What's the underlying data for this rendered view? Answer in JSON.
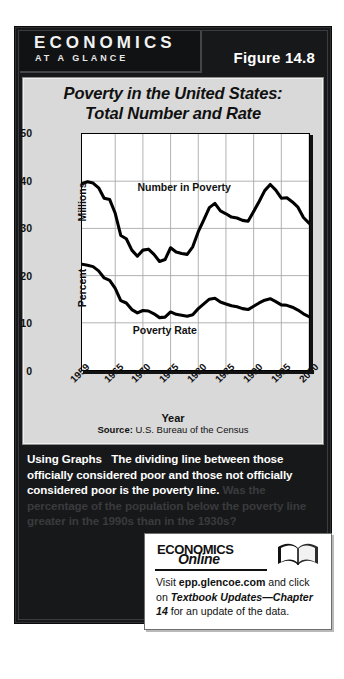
{
  "header": {
    "brand_line1": "ECONOMICS",
    "brand_line2": "AT A GLANCE",
    "figure_label": "Figure 14.8"
  },
  "chart_card": {
    "title_line1": "Poverty in the United States:",
    "title_line2": "Total Number and Rate",
    "source": "U.S. Bureau of the Census",
    "source_prefix": "Source:"
  },
  "caption": {
    "lead": "Using Graphs",
    "body": "The dividing line between those officially considered poor and those not officially considered poor is the poverty line.",
    "question": "Was the percentage of the population below the poverty line greater in the 1990s than in the 1930s?"
  },
  "online": {
    "brand_top": "ECONOMICS",
    "brand_bottom": "Online",
    "text_before": "Visit ",
    "link": "epp.glencoe.com",
    "text_mid": " and click on ",
    "emphasis": "Textbook Updates—Chapter 14",
    "text_after": " for an update of the data.",
    "icon": "open-book-icon"
  },
  "chart_data": {
    "type": "line",
    "title": "Poverty in the United States: Total Number and Rate",
    "xlabel": "Year",
    "ylabel": "Millions / Percent",
    "ylabel_upper": "Millions",
    "ylabel_lower": "Percent",
    "grid": true,
    "legend_position": "inline-annotations",
    "xlim": [
      1959,
      2000
    ],
    "ylim": [
      0,
      50
    ],
    "yticks": [
      0,
      10,
      20,
      30,
      40,
      50
    ],
    "xticks": [
      1959,
      1965,
      1970,
      1975,
      1980,
      1985,
      1990,
      1995,
      2000
    ],
    "x": [
      1959,
      1960,
      1961,
      1962,
      1963,
      1964,
      1965,
      1966,
      1967,
      1968,
      1969,
      1970,
      1971,
      1972,
      1973,
      1974,
      1975,
      1976,
      1977,
      1978,
      1979,
      1980,
      1981,
      1982,
      1983,
      1984,
      1985,
      1986,
      1987,
      1988,
      1989,
      1990,
      1991,
      1992,
      1993,
      1994,
      1995,
      1996,
      1997,
      1998,
      1999,
      2000
    ],
    "series": [
      {
        "name": "Number in Poverty",
        "unit": "millions",
        "values": [
          39.5,
          39.9,
          39.6,
          38.6,
          36.4,
          36.1,
          33.2,
          28.5,
          27.8,
          25.4,
          24.1,
          25.4,
          25.6,
          24.5,
          23.0,
          23.4,
          25.9,
          25.0,
          24.7,
          24.5,
          26.1,
          29.3,
          31.8,
          34.4,
          35.3,
          33.7,
          33.1,
          32.4,
          32.2,
          31.7,
          31.5,
          33.6,
          35.7,
          38.0,
          39.3,
          38.1,
          36.4,
          36.5,
          35.6,
          34.5,
          32.3,
          31.1
        ]
      },
      {
        "name": "Poverty Rate",
        "unit": "percent",
        "values": [
          22.4,
          22.2,
          21.9,
          21.0,
          19.5,
          19.0,
          17.3,
          14.7,
          14.2,
          12.8,
          12.1,
          12.6,
          12.5,
          11.9,
          11.1,
          11.2,
          12.3,
          11.8,
          11.6,
          11.4,
          11.7,
          13.0,
          14.0,
          15.0,
          15.2,
          14.4,
          14.0,
          13.6,
          13.4,
          13.0,
          12.8,
          13.5,
          14.2,
          14.8,
          15.1,
          14.5,
          13.8,
          13.7,
          13.3,
          12.7,
          11.9,
          11.3
        ]
      }
    ],
    "annotations": [
      {
        "text": "Number in Poverty",
        "x": 1977,
        "y": 38.5
      },
      {
        "text": "Poverty Rate",
        "x": 1974,
        "y": 8.5
      }
    ]
  }
}
